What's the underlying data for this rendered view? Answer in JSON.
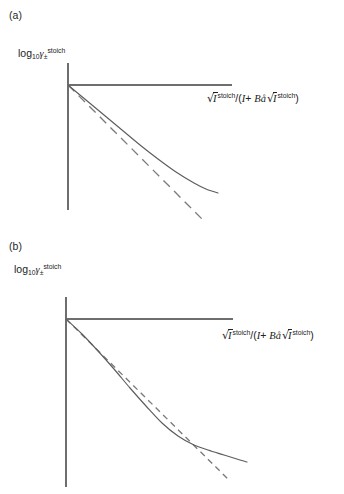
{
  "figure": {
    "background_color": "#ffffff",
    "line_color": "#5d5d5d",
    "axis_color": "#6e6e6e"
  },
  "panels": [
    {
      "id": "a",
      "label": "(a)",
      "y_axis_label_parts": {
        "log": "log",
        "base": "10",
        "gamma": "γ",
        "subscript": "±",
        "superscript": "stoich"
      },
      "x_axis_label_parts": {
        "sqrt": "√",
        "var": "I",
        "superscript": "stoich",
        "slash": "/",
        "open_paren": "(",
        "denom_var": "I",
        "plus": "+",
        "coefficient": "B",
        "ion_size": "å",
        "close_paren": ")"
      }
    },
    {
      "id": "b",
      "label": "(b)",
      "y_axis_label_parts": {
        "log": "log",
        "base": "10",
        "gamma": "γ",
        "subscript": "±",
        "superscript": "stoich"
      },
      "x_axis_label_parts": {
        "sqrt": "√",
        "var": "I",
        "superscript": "stoich",
        "slash": "/",
        "open_paren": "(",
        "denom_var": "I",
        "plus": "+",
        "coefficient": "B",
        "ion_size": "å",
        "close_paren": ")"
      }
    }
  ],
  "chart_data": [
    {
      "type": "line",
      "panel": "a",
      "title": "",
      "xlabel": "√I^stoich/(I + Bå√I^stoich)",
      "ylabel": "log10 γ±^stoich",
      "grid": false,
      "legend": "none",
      "axis_origin_px": [
        68,
        85
      ],
      "y_axis_extent_px": [
        63,
        210
      ],
      "x_axis_extent_px": [
        68,
        232
      ],
      "series": [
        {
          "name": "experimental-curve",
          "style": "solid",
          "points_px": [
            [
              68,
              85
            ],
            [
              86,
              100
            ],
            [
              104,
              115
            ],
            [
              122,
              130
            ],
            [
              140,
              145
            ],
            [
              158,
              159
            ],
            [
              176,
              172
            ],
            [
              194,
              183
            ],
            [
              206,
              189
            ],
            [
              218,
              193
            ]
          ]
        },
        {
          "name": "debye-huckel-limiting-law",
          "style": "dashed",
          "points_px": [
            [
              68,
              85
            ],
            [
              205,
              222
            ]
          ]
        }
      ]
    },
    {
      "type": "line",
      "panel": "b",
      "title": "",
      "xlabel": "√I^stoich/(I + Bå√I^stoich)",
      "ylabel": "log10 γ±^stoich",
      "grid": false,
      "legend": "none",
      "axis_origin_px": [
        66,
        319
      ],
      "y_axis_extent_px": [
        297,
        487
      ],
      "x_axis_extent_px": [
        66,
        233
      ],
      "crossing_point_px": [
        208,
        450
      ],
      "series": [
        {
          "name": "experimental-curve",
          "style": "solid",
          "points_px": [
            [
              66,
              319
            ],
            [
              82,
              334
            ],
            [
              98,
              351
            ],
            [
              114,
              369
            ],
            [
              130,
              388
            ],
            [
              146,
              406
            ],
            [
              162,
              423
            ],
            [
              178,
              436
            ],
            [
              194,
              445
            ],
            [
              208,
              450
            ],
            [
              224,
              455
            ],
            [
              240,
              460
            ],
            [
              247,
              462
            ]
          ]
        },
        {
          "name": "debye-huckel-limiting-law",
          "style": "dashed",
          "points_px": [
            [
              66,
              319
            ],
            [
              230,
              481
            ]
          ]
        }
      ]
    }
  ]
}
